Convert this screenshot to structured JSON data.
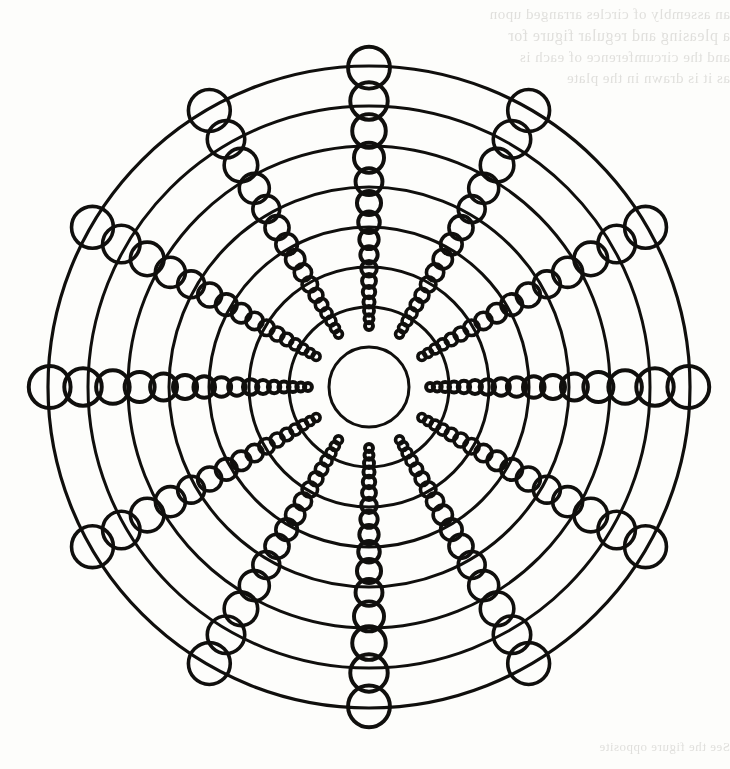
{
  "document": {
    "kind": "scanned-book-page",
    "background_color": "#fdfdfb",
    "ink_color": "#100f0d",
    "width": 730,
    "height": 769
  },
  "bleed_through": {
    "note_is_visible_text": true,
    "lines": [
      "an assembly of circles arranged upon",
      "a pleasing and regular figure for",
      "and the circumference of each is",
      "as it is drawn in the plate",
      "See the figure opposite"
    ]
  },
  "figure": {
    "center": {
      "x": 369,
      "y": 387
    },
    "outer_radius": 321,
    "stroke_color": "#100f0d",
    "ring_stroke_width": 3.0,
    "outer_ring_stroke_width": 3.2,
    "circle_stroke_width": 3.6,
    "rings": {
      "count": 8,
      "radii": [
        40,
        80,
        120,
        160,
        200,
        241,
        281,
        321
      ]
    },
    "spokes": {
      "count": 12,
      "angles_deg": [
        0,
        30,
        60,
        90,
        120,
        150,
        180,
        210,
        240,
        270,
        300,
        330
      ],
      "emphasized_angles_deg": [
        0,
        90,
        180,
        270
      ]
    },
    "chain": {
      "description": "Each spoke carries a chain of circles whose centers lie on the spoke and whose radii grow linearly with distance from the centre, so that consecutive circles overlap.",
      "growth_ratio": 0.0655,
      "min_radius": 3.0,
      "step_factor": 1.78,
      "start_radius": 4.0,
      "max_center_radius": 321
    }
  },
  "chart_data": {
    "type": "scatter",
    "xlabel": "",
    "ylabel": "",
    "grid": true,
    "legend": "none",
    "xlim": [
      -321,
      321
    ],
    "ylim": [
      -321,
      321
    ],
    "rings_radii": [
      40,
      80,
      120,
      160,
      200,
      241,
      281,
      321
    ],
    "spoke_angles_deg": [
      0,
      30,
      60,
      90,
      120,
      150,
      180,
      210,
      240,
      270,
      300,
      330
    ],
    "series": [
      {
        "name": "chain circle centers (radius along spoke)",
        "values": [
          5,
          14,
          26,
          40,
          57,
          77,
          100,
          125,
          153,
          183,
          216,
          251,
          289,
          321
        ]
      },
      {
        "name": "chain circle radii",
        "values": [
          4.0,
          5.6,
          7.5,
          9.6,
          11.9,
          14.3,
          16.8,
          19.4,
          22.1,
          24.9,
          27.7,
          30.5,
          33.3,
          36.1
        ]
      }
    ]
  }
}
